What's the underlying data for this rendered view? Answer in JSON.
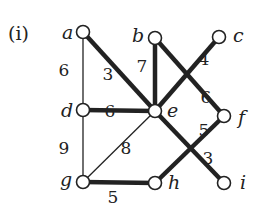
{
  "panel_label": "(i)",
  "colors": {
    "ink": "#222222",
    "background": "#ffffff"
  },
  "nodes": [
    {
      "id": "a",
      "label": "a",
      "x": 83,
      "y": 32,
      "lx": 62,
      "ly": 39
    },
    {
      "id": "b",
      "label": "b",
      "x": 155,
      "y": 38,
      "lx": 132,
      "ly": 42
    },
    {
      "id": "c",
      "label": "c",
      "x": 219,
      "y": 37,
      "lx": 233,
      "ly": 42
    },
    {
      "id": "d",
      "label": "d",
      "x": 83,
      "y": 110,
      "lx": 61,
      "ly": 117
    },
    {
      "id": "e",
      "label": "e",
      "x": 155,
      "y": 111,
      "lx": 167,
      "ly": 117
    },
    {
      "id": "f",
      "label": "f",
      "x": 224,
      "y": 116,
      "lx": 238,
      "ly": 124
    },
    {
      "id": "g",
      "label": "g",
      "x": 83,
      "y": 182,
      "lx": 60,
      "ly": 186
    },
    {
      "id": "h",
      "label": "h",
      "x": 155,
      "y": 183,
      "lx": 168,
      "ly": 189
    },
    {
      "id": "i",
      "label": "i",
      "x": 224,
      "y": 183,
      "lx": 240,
      "ly": 189
    }
  ],
  "edges": [
    {
      "from": "a",
      "to": "d",
      "weight": "6",
      "thick": false,
      "lx": 64,
      "ly": 76
    },
    {
      "from": "a",
      "to": "e",
      "weight": "3",
      "thick": true,
      "lx": 108,
      "ly": 80
    },
    {
      "from": "b",
      "to": "e",
      "weight": "7",
      "thick": true,
      "lx": 142,
      "ly": 72
    },
    {
      "from": "b",
      "to": "f",
      "weight": "6",
      "thick": true,
      "lx": 206,
      "ly": 103
    },
    {
      "from": "e",
      "to": "c",
      "weight": "4",
      "thick": true,
      "lx": 204,
      "ly": 65
    },
    {
      "from": "d",
      "to": "e",
      "weight": "6",
      "thick": true,
      "lx": 110,
      "ly": 117
    },
    {
      "from": "d",
      "to": "g",
      "weight": "9",
      "thick": false,
      "lx": 64,
      "ly": 154
    },
    {
      "from": "g",
      "to": "e",
      "weight": "8",
      "thick": false,
      "lx": 126,
      "ly": 154
    },
    {
      "from": "g",
      "to": "h",
      "weight": "5",
      "thick": true,
      "lx": 113,
      "ly": 203
    },
    {
      "from": "h",
      "to": "f",
      "weight": "5",
      "thick": true,
      "lx": 204,
      "ly": 136
    },
    {
      "from": "e",
      "to": "i",
      "weight": "3",
      "thick": true,
      "lx": 208,
      "ly": 164
    }
  ]
}
